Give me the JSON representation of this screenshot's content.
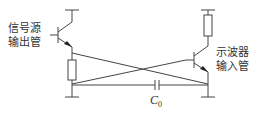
{
  "diagram": {
    "type": "circuit",
    "labels": {
      "left_transistor_line1": "信号源",
      "left_transistor_line2": "输出管",
      "right_transistor_line1": "示波器",
      "right_transistor_line2": "输入管",
      "capacitor_symbol": "C",
      "capacitor_subscript": "0"
    },
    "components": [
      {
        "id": "Q1",
        "kind": "npn-transistor",
        "label": "信号源输出管"
      },
      {
        "id": "R1",
        "kind": "resistor",
        "position": "left emitter"
      },
      {
        "id": "Q2",
        "kind": "npn-transistor",
        "label": "示波器输入管"
      },
      {
        "id": "R2",
        "kind": "resistor",
        "position": "right collector"
      },
      {
        "id": "C0",
        "kind": "capacitor",
        "label": "C0"
      }
    ],
    "colors": {
      "line": "#444444",
      "text": "#333333",
      "background": "#ffffff"
    }
  }
}
